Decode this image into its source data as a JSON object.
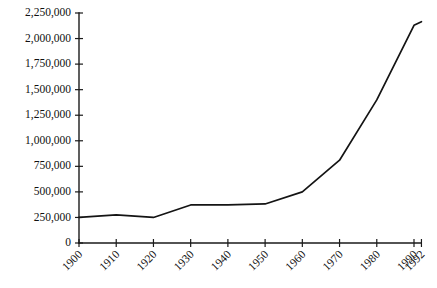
{
  "chart_data": {
    "type": "line",
    "title": "",
    "subtitle": "",
    "xlabel": "",
    "ylabel": "",
    "grid": false,
    "legend": false,
    "legend_position": "none",
    "x": [
      1900,
      1910,
      1920,
      1930,
      1940,
      1950,
      1960,
      1970,
      1980,
      1990,
      1992
    ],
    "values": [
      250000,
      275000,
      250000,
      372000,
      372000,
      382000,
      500000,
      810000,
      1400000,
      2130000,
      2165000
    ],
    "series": [
      {
        "name": "Population",
        "values": [
          250000,
          275000,
          250000,
          372000,
          372000,
          382000,
          500000,
          810000,
          1400000,
          2130000,
          2165000
        ]
      }
    ],
    "xlim": [
      1900,
      1992
    ],
    "ylim": [
      0,
      2250000
    ],
    "x_tick_labels": [
      "1900",
      "1910",
      "1920",
      "1930",
      "1940",
      "1950",
      "1960",
      "1970",
      "1980",
      "1990",
      "1992"
    ],
    "y_tick_labels": [
      "0",
      "250,000",
      "500,000",
      "750,000",
      "1,000,000",
      "1,250,000",
      "1,500,000",
      "1,750,000",
      "2,000,000",
      "2,250,000"
    ],
    "y_tick_values": [
      0,
      250000,
      500000,
      750000,
      1000000,
      1250000,
      1500000,
      1750000,
      2000000,
      2250000
    ],
    "line_color": "#141414",
    "axis_color": "#1a1a1a",
    "background_color": "#ffffff",
    "x_label_rotation": -45
  },
  "caption": {
    "ghost_text": ""
  }
}
